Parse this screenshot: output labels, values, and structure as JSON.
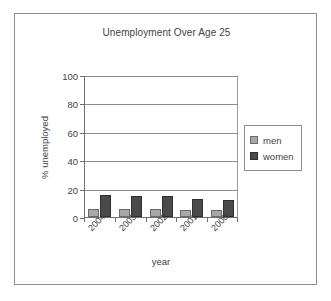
{
  "chart_data": {
    "type": "bar",
    "title": "Unemployment Over Age 25",
    "xlabel": "year",
    "ylabel": "% unemployed",
    "categories": [
      "2004",
      "2003",
      "2002",
      "2001",
      "2000"
    ],
    "series": [
      {
        "name": "men",
        "color": "#a8a8a8",
        "values": [
          5.5,
          5.5,
          5.5,
          5.0,
          5.0
        ]
      },
      {
        "name": "women",
        "color": "#4a4a4a",
        "values": [
          15.5,
          15.0,
          14.5,
          13.0,
          12.0
        ]
      }
    ],
    "ylim": [
      0,
      100
    ],
    "yticks": [
      100,
      80,
      60,
      40,
      20,
      0
    ],
    "grid": true,
    "legend_position": "right",
    "frame_color": "#8d8d93",
    "axis_color": "#6f6f6f",
    "gridline_color": "#8c8c8c"
  }
}
